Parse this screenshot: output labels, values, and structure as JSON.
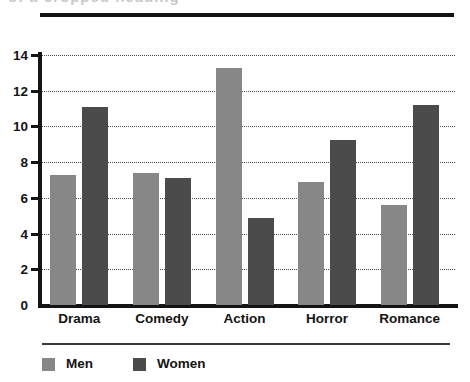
{
  "chart_data": {
    "type": "bar",
    "title": "",
    "xlabel": "",
    "ylabel": "",
    "categories": [
      "Drama",
      "Comedy",
      "Action",
      "Horror",
      "Romance"
    ],
    "series": [
      {
        "name": "Men",
        "color": "#878787",
        "values": [
          7.3,
          7.4,
          13.3,
          6.9,
          5.6
        ]
      },
      {
        "name": "Women",
        "color": "#4b4b4b",
        "values": [
          11.1,
          7.1,
          4.9,
          9.25,
          11.2
        ]
      }
    ],
    "ylim": [
      0,
      14
    ],
    "y_ticks": [
      0,
      2,
      4,
      6,
      8,
      10,
      12,
      14
    ],
    "y_tick_labels": [
      "0",
      "2",
      "4",
      "6",
      "8",
      "10",
      "12",
      "14"
    ],
    "grid": true,
    "grid_style": "dotted-horizontal",
    "legend_position": "bottom-left",
    "legend_entries": [
      "Men",
      "Women"
    ]
  },
  "axis": {
    "y_labels": [
      "14",
      "12",
      "10",
      "8",
      "6",
      "4",
      "2",
      "0"
    ]
  },
  "categories": {
    "labels": [
      "Drama",
      "Comedy",
      "Action",
      "Horror",
      "Romance"
    ]
  },
  "legend": {
    "items": [
      {
        "label": "Men"
      },
      {
        "label": "Women"
      }
    ]
  },
  "decor": {
    "top_sliver_text": "of a cropped heading"
  }
}
